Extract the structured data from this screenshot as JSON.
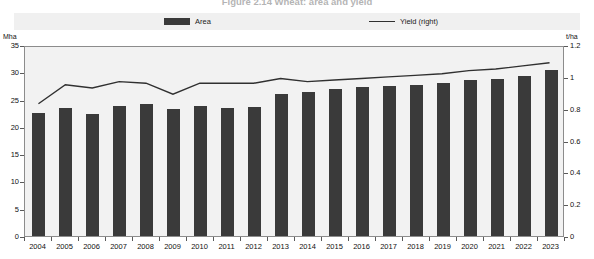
{
  "title": "Figure 2.14  Wheat: area and yield",
  "legend": {
    "items": [
      {
        "label": "Area",
        "type": "bar",
        "color": "#3a3a3a"
      },
      {
        "label": "Yield (right)",
        "type": "line",
        "color": "#303030"
      }
    ]
  },
  "axes": {
    "left_unit": "Mha",
    "right_unit": "t/ha",
    "left_ticks": [
      "0",
      "5",
      "10",
      "15",
      "20",
      "25",
      "30",
      "35"
    ],
    "right_ticks": [
      "0",
      "0.2",
      "0.4",
      "0.6",
      "0.8",
      "1",
      "1.2"
    ]
  },
  "chart_data": {
    "type": "bar",
    "title": "Figure 2.14  Wheat: area and yield",
    "xlabel": "",
    "ylabel": "Mha",
    "y2label": "t/ha",
    "ylim": [
      0,
      35
    ],
    "y2lim": [
      0,
      1.2
    ],
    "grid": false,
    "legend_position": "top",
    "categories": [
      "2004",
      "2005",
      "2006",
      "2007",
      "2008",
      "2009",
      "2010",
      "2011",
      "2012",
      "2013",
      "2014",
      "2015",
      "2016",
      "2017",
      "2018",
      "2019",
      "2020",
      "2021",
      "2022",
      "2023"
    ],
    "series": [
      {
        "name": "Area",
        "type": "bar",
        "unit": "Mha",
        "axis": "left",
        "color": "#3a3a3a",
        "values": [
          22.6,
          23.5,
          22.4,
          23.8,
          24.1,
          23.2,
          23.9,
          23.5,
          23.6,
          26.1,
          26.4,
          27.0,
          27.3,
          27.5,
          27.7,
          28.0,
          28.5,
          28.7,
          29.4,
          30.5
        ]
      },
      {
        "name": "Yield (right)",
        "type": "line",
        "unit": "t/ha",
        "axis": "right",
        "color": "#303030",
        "values": [
          0.84,
          0.96,
          0.94,
          0.98,
          0.97,
          0.9,
          0.97,
          0.97,
          0.97,
          1.0,
          0.98,
          0.99,
          1.0,
          1.01,
          1.02,
          1.03,
          1.05,
          1.06,
          1.08,
          1.1
        ]
      }
    ]
  }
}
